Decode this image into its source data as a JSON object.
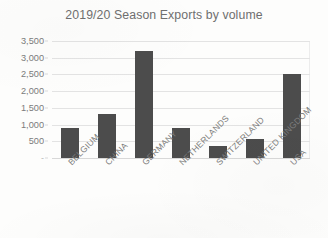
{
  "chart_data": {
    "type": "bar",
    "title": "2019/20 Season Exports by volume",
    "xlabel": "",
    "ylabel": "",
    "categories": [
      "BELGIUM",
      "CHINA",
      "GERMANY",
      "NETHERLANDS",
      "SWITZERLAND",
      "UNITED KINGDOM",
      "USA"
    ],
    "values": [
      910,
      1320,
      3200,
      900,
      350,
      570,
      2500
    ],
    "series": [
      {
        "name": "Volume",
        "values": [
          910,
          1320,
          3200,
          900,
          350,
          570,
          2500
        ]
      }
    ],
    "ylim": [
      0,
      3500
    ],
    "y_ticks": [
      0,
      500,
      1000,
      1500,
      2000,
      2500,
      3000,
      3500
    ],
    "y_tick_labels": [
      "-",
      "500",
      "1,000",
      "1,500",
      "2,000",
      "2,500",
      "3,000",
      "3,500"
    ],
    "grid": true,
    "legend": false,
    "legend_position": "none",
    "bar_color": "#4c4c4c",
    "gridline_color": "#e3e3e3",
    "text_color": "#7b7b7b",
    "background_color": "#fdfdfc"
  }
}
